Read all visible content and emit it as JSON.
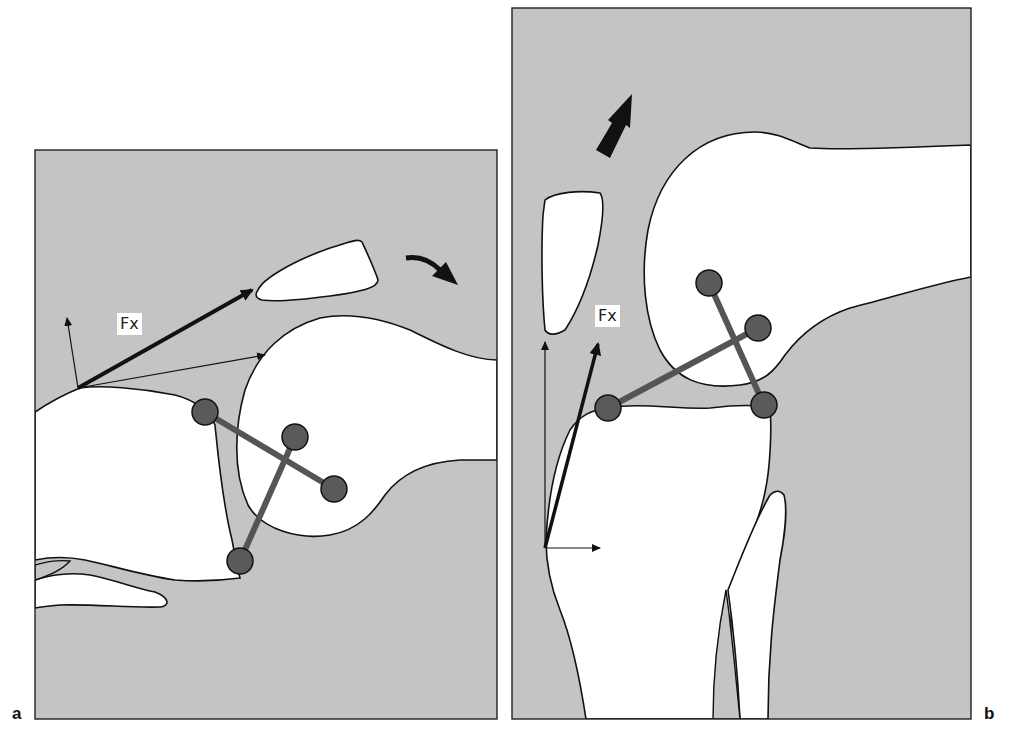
{
  "figure": {
    "panels": [
      {
        "id": "a",
        "label": "a",
        "force_label": "Fx",
        "view": "knee in flexion (lateral)"
      },
      {
        "id": "b",
        "label": "b",
        "force_label": "Fx",
        "view": "knee near extension (lateral)"
      }
    ],
    "colors": {
      "soft_tissue_gray": "#c4c4c4",
      "bone_white": "#ffffff",
      "outline": "#111111",
      "ligament_rod": "#555555",
      "ligament_ball": "#5a5a5a",
      "arrow": "#111111"
    }
  }
}
